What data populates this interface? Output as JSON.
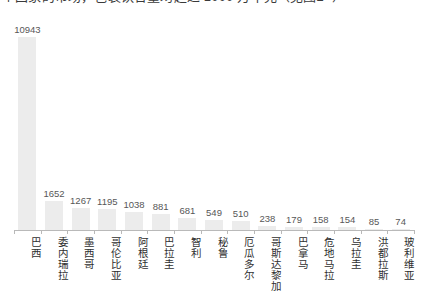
{
  "caption": {
    "clipped_top_line": "个国家的市场，包装饮合量均超过 1000 万千克（见图2- ）"
  },
  "chart_data": {
    "type": "bar",
    "title": "",
    "xlabel": "",
    "ylabel": "",
    "grid": false,
    "legend": "none",
    "ylim": [
      0,
      10943
    ],
    "categories": [
      "巴西",
      "委内瑞拉",
      "墨西哥",
      "哥伦比亚",
      "阿根廷",
      "巴拉圭",
      "智利",
      "秘鲁",
      "厄瓜多尔",
      "哥斯达黎加",
      "巴拿马",
      "危地马拉",
      "乌拉圭",
      "洪都拉斯",
      "玻利维亚"
    ],
    "values": [
      10943,
      1652,
      1267,
      1195,
      1038,
      881,
      681,
      549,
      510,
      238,
      179,
      158,
      154,
      85,
      74
    ],
    "value_labels": [
      "10943",
      "1652",
      "1267",
      "1195",
      "1038",
      "881",
      "681",
      "549",
      "510",
      "238",
      "179",
      "158",
      "154",
      "85",
      "74"
    ],
    "bar_color": "#ececec",
    "axis_color": "#b9b9b9",
    "label_color": "#2f2f2f",
    "value_color": "#575757"
  }
}
